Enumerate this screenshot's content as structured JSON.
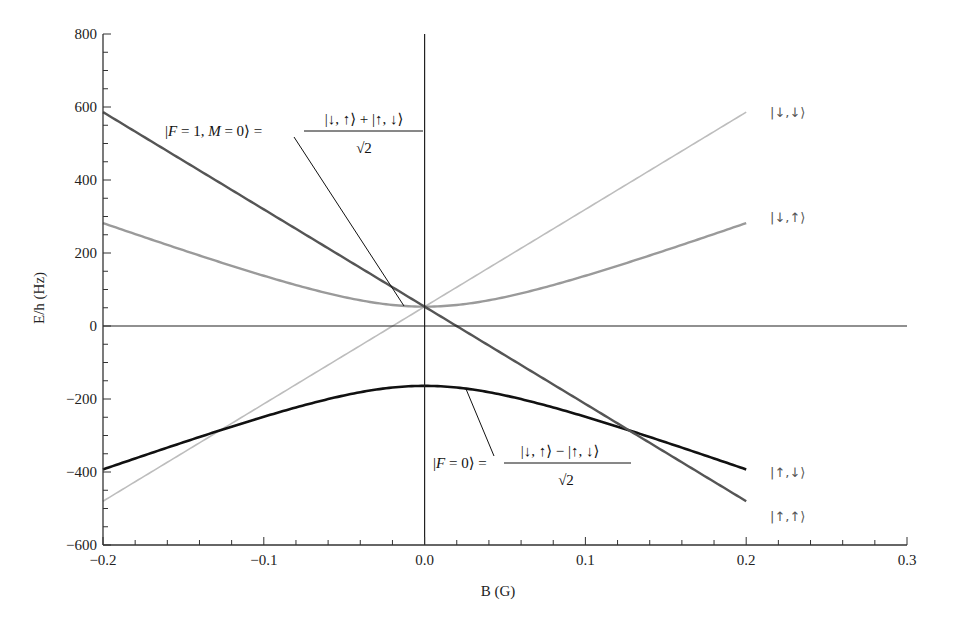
{
  "chart_data": {
    "type": "line",
    "title": "",
    "xlabel": "B (G)",
    "ylabel": "E/h (Hz)",
    "xlim": [
      -0.2,
      0.3
    ],
    "ylim": [
      -600,
      800
    ],
    "x_ticks": [
      -0.2,
      -0.1,
      0.0,
      0.1,
      0.2,
      0.3
    ],
    "x_tick_labels": [
      "−0.2",
      "−0.1",
      "0.0",
      "0.1",
      "0.2",
      "0.3"
    ],
    "y_ticks": [
      -600,
      -400,
      -200,
      0,
      200,
      400,
      600,
      800
    ],
    "y_tick_labels": [
      "−600",
      "−400",
      "−200",
      "0",
      "200",
      "400",
      "600",
      "800"
    ],
    "x_minor_step": 0.02,
    "y_minor_step": 50,
    "grid": false,
    "reference_lines": [
      {
        "orientation": "horizontal",
        "value": 0
      },
      {
        "orientation": "vertical",
        "value": 0
      }
    ],
    "x_data_range": [
      -0.2,
      0.2
    ],
    "series": [
      {
        "name": "|↓,↓⟩",
        "color": "#bdbdbd",
        "width": 1.6,
        "model": "linear",
        "offset": 53,
        "slope": 2665,
        "x": [
          -0.2,
          -0.1,
          0.0,
          0.1,
          0.2
        ],
        "values": [
          -480,
          -214,
          53,
          320,
          586
        ]
      },
      {
        "name": "|↓,↑⟩",
        "color": "#9a9a9a",
        "width": 2.4,
        "model": "avoided_upper",
        "center": -55.5,
        "half_gap": 108.5,
        "k": 1598,
        "x": [
          -0.2,
          -0.1,
          0.0,
          0.1,
          0.2
        ],
        "values": [
          282,
          137,
          53,
          137,
          282
        ]
      },
      {
        "name": "|↑,↓⟩",
        "color": "#111111",
        "width": 2.6,
        "model": "avoided_lower",
        "center": -55.5,
        "half_gap": 108.5,
        "k": 1598,
        "x": [
          -0.2,
          -0.1,
          0.0,
          0.1,
          0.2
        ],
        "values": [
          -393,
          -248,
          -164,
          -248,
          -393
        ]
      },
      {
        "name": "|↑,↑⟩",
        "color": "#555555",
        "width": 2.4,
        "model": "linear",
        "offset": 53,
        "slope": -2665,
        "x": [
          -0.2,
          -0.1,
          0.0,
          0.1,
          0.2
        ],
        "values": [
          586,
          320,
          53,
          -214,
          -480
        ]
      }
    ],
    "state_labels": [
      {
        "text": "|↓,↓⟩",
        "x_px": 770,
        "y_px": 117
      },
      {
        "text": "|↓,↑⟩",
        "x_px": 770,
        "y_px": 222
      },
      {
        "text": "|↑,↓⟩",
        "x_px": 770,
        "y_px": 477
      },
      {
        "text": "|↑,↑⟩",
        "x_px": 770,
        "y_px": 521
      }
    ],
    "annotations": [
      {
        "lhs_open": "|",
        "lhs_italic": "F",
        "lhs_mid": " = 1, ",
        "lhs_italic2": "M",
        "lhs_close": " = 0⟩ =",
        "numerator": "|↓, ↑⟩ + |↑, ↓⟩",
        "denominator": "√2",
        "pointer_from": [
          294,
          137
        ],
        "pointer_to": [
          404,
          306
        ]
      },
      {
        "lhs_open": "|",
        "lhs_italic": "F",
        "lhs_close": " = 0⟩ =",
        "numerator": "|↓, ↑⟩ − |↑, ↓⟩",
        "denominator": "√2",
        "pointer_from": [
          494,
          456
        ],
        "pointer_to": [
          466,
          389
        ]
      }
    ]
  }
}
